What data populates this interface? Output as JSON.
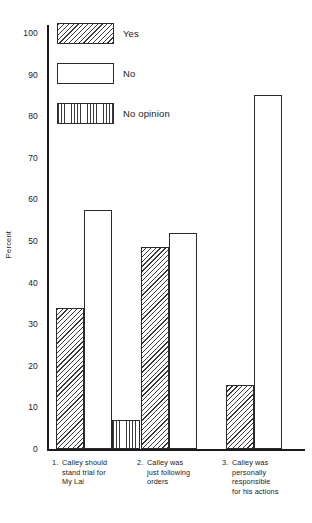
{
  "chart_data": {
    "type": "bar",
    "title": "",
    "subtitle": "",
    "xlabel": "",
    "ylabel": "Percent",
    "ylim": [
      0,
      100
    ],
    "ytick_step": 10,
    "yticks": [
      "0",
      "10",
      "20",
      "30",
      "40",
      "50",
      "60",
      "70",
      "80",
      "90",
      "100"
    ],
    "grid": false,
    "legend_position": "top-left-inside",
    "categories": [
      "1. Calley should stand trial for My Lai",
      "2. Calley was just following orders",
      "3. Calley was personally responsible for his actions"
    ],
    "series": [
      {
        "name": "Yes",
        "pattern": "diagonal-hatch",
        "values": [
          34,
          48.5,
          15.5
        ]
      },
      {
        "name": "No",
        "pattern": "empty",
        "values": [
          57.5,
          52,
          85
        ]
      },
      {
        "name": "No opinion",
        "pattern": "vertical-lines",
        "values": [
          7,
          null,
          null
        ]
      }
    ]
  },
  "legend": {
    "items": [
      {
        "label": "Yes",
        "pattern": "diagonal-hatch"
      },
      {
        "label": "No",
        "pattern": "empty"
      },
      {
        "label": "No opinion",
        "pattern": "vertical-lines"
      }
    ]
  },
  "axes": {
    "y_title": "Percent",
    "y_ticks": [
      {
        "label": "100",
        "value": 100
      },
      {
        "label": "90",
        "value": 90
      },
      {
        "label": "80",
        "value": 80
      },
      {
        "label": "70",
        "value": 70
      },
      {
        "label": "60",
        "value": 60
      },
      {
        "label": "50",
        "value": 50
      },
      {
        "label": "40",
        "value": 40
      },
      {
        "label": "30",
        "value": 30
      },
      {
        "label": "20",
        "value": 20
      },
      {
        "label": "10",
        "value": 10
      },
      {
        "label": "0",
        "value": 0
      }
    ]
  },
  "categories_display": [
    {
      "number": "1.",
      "lines": [
        "Calley should",
        "stand trial for",
        "My Lai"
      ]
    },
    {
      "number": "2.",
      "lines": [
        "Calley was",
        "just following",
        "orders"
      ]
    },
    {
      "number": "3.",
      "lines": [
        "Calley was",
        "personally",
        "responsible",
        "for his actions"
      ]
    }
  ],
  "colors": {
    "axis": "#1a1a1a",
    "bar_outline": "#2a2a2a",
    "hatch": "#3a3a3a",
    "background": "#ffffff"
  }
}
